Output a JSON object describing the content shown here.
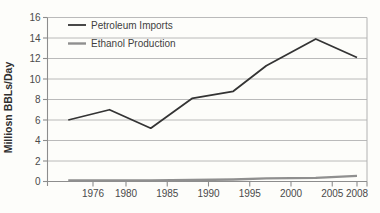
{
  "figure": {
    "background": "#fdfdfa"
  },
  "chart_data": {
    "type": "line",
    "title": "",
    "xlabel": "",
    "ylabel": "Milliosn BBLs/Day",
    "x": [
      1973,
      1978,
      1983,
      1988,
      1993,
      1997,
      2003,
      2008
    ],
    "series": [
      {
        "name": "Petroleum Imports",
        "color": "#343434",
        "stroke_width": 1.8,
        "values": [
          6.0,
          7.0,
          5.2,
          8.1,
          8.8,
          11.3,
          13.9,
          12.1
        ]
      },
      {
        "name": "Ethanol Production",
        "color": "#8f8f8f",
        "stroke_width": 2.4,
        "values": [
          0.1,
          0.1,
          0.1,
          0.15,
          0.2,
          0.3,
          0.35,
          0.55
        ]
      }
    ],
    "x_ticks": [
      1976,
      1980,
      1985,
      1990,
      1995,
      2000,
      2005,
      2008
    ],
    "y_ticks": [
      0,
      2,
      4,
      6,
      8,
      10,
      12,
      14,
      16
    ],
    "ylim": [
      0,
      16
    ],
    "grid": "horizontal",
    "legend_position": "top-left-inside",
    "colors": {
      "axis": "#8d8d8d",
      "grid": "#b2b2b2",
      "tick_label": "#4a4a4a",
      "legend_text": "#3f3f3f",
      "ylabel_text": "#2f2f2f"
    }
  }
}
